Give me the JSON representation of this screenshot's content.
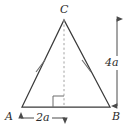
{
  "figure": {
    "kind": "geometry-diagram",
    "background_color": "#ffffff",
    "stroke_color": "#3a3a3a",
    "dashed_color": "#9a9a9a",
    "text_color": "#2b2b2b",
    "vertices": [
      {
        "name": "A",
        "label": "A",
        "x": 22,
        "y": 107
      },
      {
        "name": "B",
        "label": "B",
        "x": 110,
        "y": 107
      },
      {
        "name": "C",
        "label": "C",
        "x": 64,
        "y": 20
      }
    ],
    "altitude": {
      "from": "C",
      "foot_x": 64,
      "foot_y": 107,
      "style": "dashed",
      "right_angle_marker": true
    },
    "congruence_ticks": {
      "count": 1,
      "sides": [
        "AC",
        "BC"
      ]
    },
    "dimensions": [
      {
        "name": "height-dimension",
        "label": "4a",
        "orientation": "vertical",
        "x": 117,
        "y_start": 18,
        "y_end": 107,
        "arrowheads": "both"
      },
      {
        "name": "half-base-dimension",
        "label": "2a",
        "orientation": "horizontal",
        "y": 118,
        "x_start": 20,
        "x_end": 66,
        "arrowheads": "both"
      }
    ]
  }
}
